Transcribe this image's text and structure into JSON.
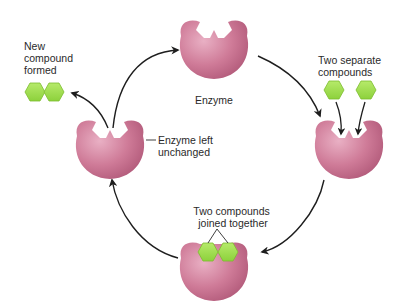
{
  "diagram": {
    "colors": {
      "enzyme": "#c9708f",
      "enzyme_light": "#e7a9bf",
      "enzyme_dark": "#a94f71",
      "compound": "#9fdc4a",
      "compound_stroke": "#7cbc2e",
      "arrow": "#1e1e1e",
      "text": "#2a2a2a"
    },
    "stages": [
      {
        "id": "enzyme",
        "label": "Enzyme"
      },
      {
        "id": "substrates",
        "label_lines": [
          "Two separate",
          "compounds"
        ]
      },
      {
        "id": "complex",
        "label_lines": [
          "Two compounds",
          "joined together"
        ]
      },
      {
        "id": "released",
        "label_lines": [
          "Enzyme left",
          "unchanged"
        ]
      }
    ],
    "product": {
      "label_lines": [
        "New",
        "compound",
        "formed"
      ]
    }
  }
}
